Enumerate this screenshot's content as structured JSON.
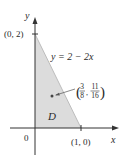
{
  "figure": {
    "axes": {
      "x_label": "x",
      "y_label": "y",
      "origin_label": "0"
    },
    "region": {
      "label": "D",
      "vertices": [
        [
          0,
          0
        ],
        [
          1,
          0
        ],
        [
          0,
          2
        ]
      ],
      "fill": "#dcdcdc"
    },
    "curve": {
      "equation_label": "y = 2 − 2x"
    },
    "points": {
      "y_intercept": "(0, 2)",
      "x_intercept": "(1, 0)",
      "centroid": {
        "x_num": "3",
        "x_den": "8",
        "y_num": "11",
        "y_den": "16"
      }
    }
  }
}
